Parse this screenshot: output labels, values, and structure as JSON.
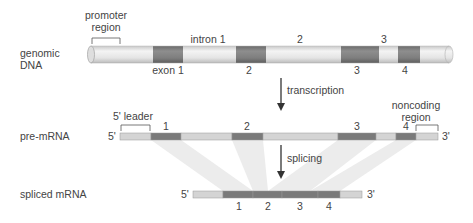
{
  "labels": {
    "genomic_dna_line1": "genomic",
    "genomic_dna_line2": "DNA",
    "pre_mrna": "pre-mRNA",
    "spliced_mrna": "spliced mRNA",
    "promoter_line1": "promoter",
    "promoter_line2": "region",
    "intron1": "intron 1",
    "intron2": "2",
    "intron3": "3",
    "exon1": "exon 1",
    "exon2": "2",
    "exon3": "3",
    "exon4": "4",
    "transcription": "transcription",
    "splicing": "splicing",
    "leader": "5' leader",
    "noncoding_line1": "noncoding",
    "noncoding_line2": "region",
    "pre_exon1": "1",
    "pre_exon2": "2",
    "pre_exon3": "3",
    "pre_exon4": "4",
    "pre_5prime": "5'",
    "pre_3prime": "3'",
    "sp_5prime": "5'",
    "sp_3prime": "3'",
    "sp_exon1": "1",
    "sp_exon2": "2",
    "sp_exon3": "3",
    "sp_exon4": "4"
  },
  "colors": {
    "exon": "#7a7a7a",
    "intron": "#d4d4d4",
    "cylinder_light": "#e8e8e8",
    "band": "#ececec",
    "text": "#444444"
  }
}
